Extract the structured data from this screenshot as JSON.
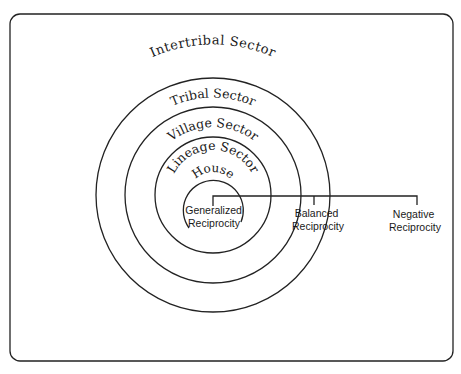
{
  "diagram": {
    "sectors": [
      {
        "label": "Intertribal Sector"
      },
      {
        "label": "Tribal Sector"
      },
      {
        "label": "Village Sector"
      },
      {
        "label": "Lineage Sector"
      },
      {
        "label": "House"
      }
    ],
    "reciprocity": [
      {
        "line1": "Generalized",
        "line2": "Reciprocity"
      },
      {
        "line1": "Balanced",
        "line2": "Reciprocity"
      },
      {
        "line1": "Negative",
        "line2": "Reciprocity"
      }
    ]
  }
}
